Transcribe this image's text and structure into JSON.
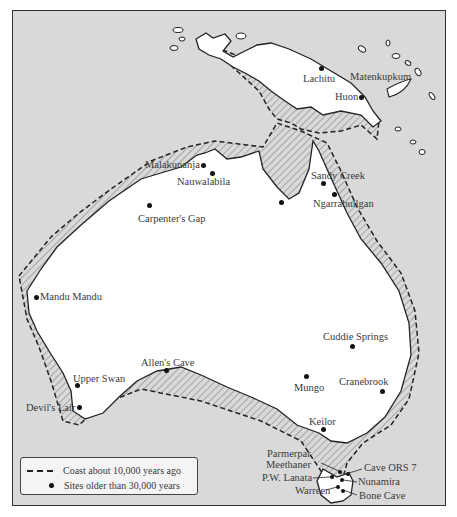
{
  "map": {
    "title": "Ancient Sahul sites",
    "colors": {
      "sea": "#d9d9d9",
      "land": "#ffffff",
      "shelf_hatch": "#8a8a8a",
      "outline": "#222222",
      "site": "#111111"
    }
  },
  "legend": {
    "items": [
      {
        "symbol": "dashed-line",
        "label": "Coast about 10,000 years ago"
      },
      {
        "symbol": "dot",
        "label": "Sites older than 30,000 years"
      }
    ]
  },
  "sites": [
    {
      "name": "Lachitu",
      "x": 320,
      "y": 66,
      "lx": 302,
      "ly": 72
    },
    {
      "name": "Matenkupkum",
      "x": 0,
      "y": 0,
      "lx": 349,
      "ly": 63
    },
    {
      "name": "Huon",
      "x": 360,
      "y": 95,
      "lx": 334,
      "ly": 89
    },
    {
      "name": "Malakunanja",
      "x": 202,
      "y": 163,
      "lx": 144,
      "ly": 157
    },
    {
      "name": "Nauwalabila",
      "x": 211,
      "y": 171,
      "lx": 174,
      "ly": 175
    },
    {
      "name": "Carpenter's Gap",
      "x": 148,
      "y": 203,
      "lx": 135,
      "ly": 209
    },
    {
      "name": "Sandy Creek",
      "x": 322,
      "y": 180,
      "lx": 309,
      "ly": 167
    },
    {
      "name": "Ngarrabullgan",
      "x": 332,
      "y": 191,
      "lx": 312,
      "ly": 196
    },
    {
      "name": "Mandu Mandu",
      "x": 35,
      "y": 295,
      "lx": 40,
      "ly": 290
    },
    {
      "name": "Cuddie Springs",
      "x": 350,
      "y": 344,
      "lx": 322,
      "ly": 330
    },
    {
      "name": "Allen's Cave",
      "x": 164,
      "y": 368,
      "lx": 139,
      "ly": 355
    },
    {
      "name": "Upper Swan",
      "x": 75,
      "y": 383,
      "lx": 72,
      "ly": 374
    },
    {
      "name": "Mungo",
      "x": 304,
      "y": 374,
      "lx": 291,
      "ly": 380
    },
    {
      "name": "Cranebrook",
      "x": 380,
      "y": 389,
      "lx": 338,
      "ly": 374
    },
    {
      "name": "Devil's Lair",
      "x": 77,
      "y": 406,
      "lx": 25,
      "ly": 400
    },
    {
      "name": "Keilor",
      "x": 321,
      "y": 427,
      "lx": 308,
      "ly": 415
    }
  ],
  "tasmania_sites": [
    {
      "name": "Parmerpar Meethaner",
      "line1": "Parmerpar",
      "line2": "Meethaner",
      "lx": 266,
      "ly": 448
    },
    {
      "name": "Cave ORS 7",
      "lx": 364,
      "ly": 462
    },
    {
      "name": "P.W. Lanata",
      "lx": 261,
      "ly": 473
    },
    {
      "name": "Nunamira",
      "lx": 357,
      "ly": 476
    },
    {
      "name": "Warreen",
      "lx": 294,
      "ly": 485
    },
    {
      "name": "Bone Cave",
      "lx": 358,
      "ly": 490
    }
  ]
}
